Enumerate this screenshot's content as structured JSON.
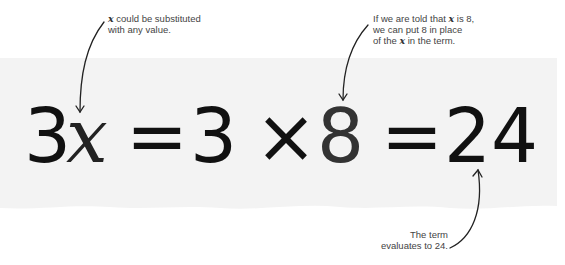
{
  "equation": {
    "tokens": [
      {
        "text": "3",
        "role": "coefficient"
      },
      {
        "text": "x",
        "role": "variable"
      },
      {
        "text": "=",
        "role": "operator"
      },
      {
        "text": "3",
        "role": "coefficient"
      },
      {
        "text": "×",
        "role": "operator"
      },
      {
        "text": "8",
        "role": "substituted-value"
      },
      {
        "text": "=",
        "role": "operator"
      },
      {
        "text": "24",
        "role": "result"
      }
    ]
  },
  "annotations": {
    "variable_note": {
      "var": "x",
      "line1": " could be substituted",
      "line2": "with any value."
    },
    "substitution_note": {
      "line1a": "If we are told that ",
      "var1": "x",
      "line1b": " is 8,",
      "line2": "we can put 8 in place",
      "line3a": "of the ",
      "var2": "x",
      "line3b": " in the term."
    },
    "result_note": {
      "line1": "The term",
      "line2": "evaluates to 24."
    }
  },
  "colors": {
    "background": "#ffffff",
    "strip": "#f3f3f3",
    "text": "#111111",
    "note_text": "#444444",
    "arrow": "#222222"
  }
}
